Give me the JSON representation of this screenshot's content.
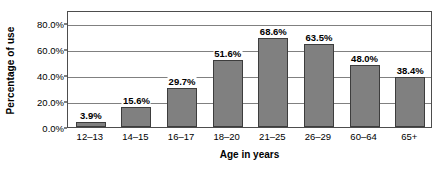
{
  "chart_data": {
    "type": "bar",
    "title": "",
    "subtitle": "",
    "xlabel": "Age in years",
    "ylabel": "Percentage of use",
    "categories": [
      "12–13",
      "14–15",
      "16–17",
      "18–20",
      "21–25",
      "26–29",
      "60–64",
      "65+"
    ],
    "values": [
      3.9,
      15.6,
      29.7,
      51.6,
      68.6,
      63.5,
      48.0,
      38.4
    ],
    "data_labels": [
      "3.9%",
      "15.6%",
      "29.7%",
      "51.6%",
      "68.6%",
      "63.5%",
      "48.0%",
      "38.4%"
    ],
    "ylim": [
      0,
      90
    ],
    "yticks": [
      0,
      20,
      40,
      60,
      80
    ],
    "ytick_labels": [
      "0.0%",
      "20.0%",
      "40.0%",
      "60.0%",
      "80.0%"
    ],
    "grid": true,
    "grid_axis": "y",
    "legend": false,
    "legend_position": "none",
    "bar_color": "#808080",
    "bar_border_color": "#3d3d3d",
    "gridline_color": "#808080",
    "axis_color": "#4d4d4d",
    "background_color": "#ffffff",
    "text_color": "#000000"
  }
}
